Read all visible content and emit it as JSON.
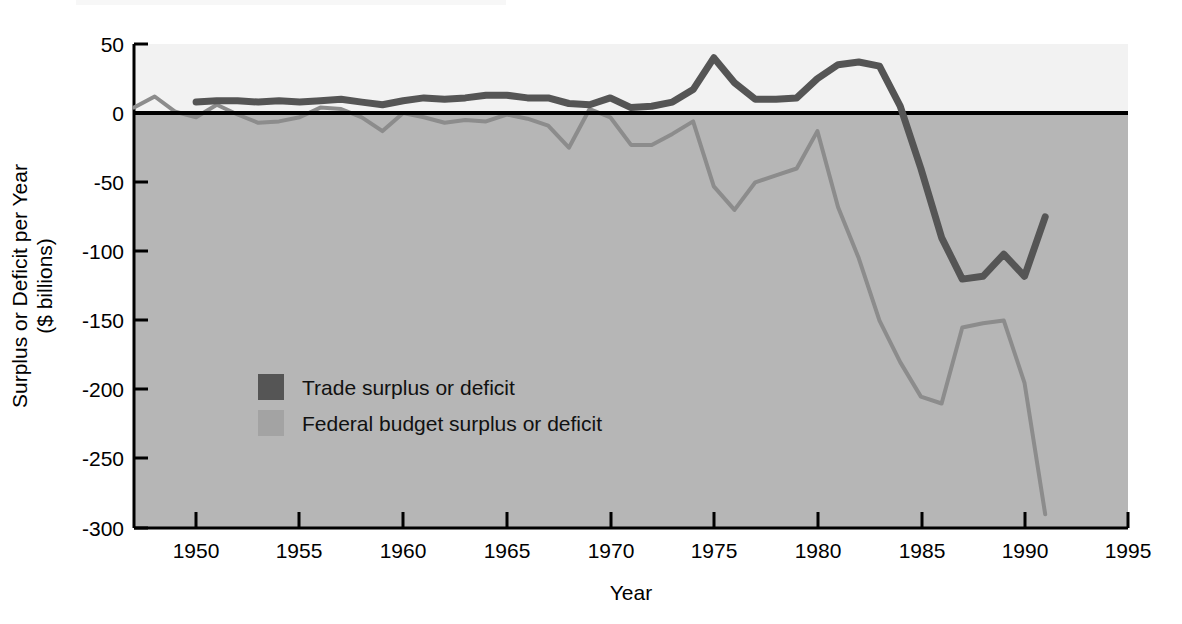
{
  "chart_data": {
    "type": "line",
    "title": "",
    "xlabel": "Year",
    "ylabel": "Surplus or Deficit per Year\n($ billions)",
    "ylabel_line1": "Surplus or Deficit per Year",
    "ylabel_line2": "($ billions)",
    "xlim": [
      1947,
      1995
    ],
    "ylim": [
      -300,
      50
    ],
    "xticks": [
      1950,
      1955,
      1960,
      1965,
      1970,
      1975,
      1980,
      1985,
      1990,
      1995
    ],
    "xtick_labels": [
      "1950",
      "1955",
      "1960",
      "1965",
      "1970",
      "1975",
      "1980",
      "1985",
      "1990",
      "1995"
    ],
    "yticks": [
      50,
      0,
      -50,
      -100,
      -150,
      -200,
      -250,
      -300
    ],
    "ytick_labels": [
      "50",
      "0",
      "-50",
      "-100",
      "-150",
      "-200",
      "-250",
      "-300"
    ],
    "grid": false,
    "legend_position": "center-left",
    "zero_line": 0,
    "plot_bg_above_zero": "#f2f2f2",
    "plot_bg_below_zero": "#b6b6b6",
    "series": [
      {
        "name": "Trade surplus or deficit",
        "color": "#555555",
        "line_width": 6,
        "x": [
          1950,
          1951,
          1952,
          1953,
          1954,
          1955,
          1956,
          1957,
          1958,
          1959,
          1960,
          1961,
          1962,
          1963,
          1964,
          1965,
          1966,
          1967,
          1968,
          1969,
          1970,
          1971,
          1972,
          1973,
          1974,
          1975,
          1976,
          1977,
          1978,
          1979,
          1980,
          1981,
          1982,
          1983,
          1984,
          1985,
          1986,
          1987,
          1988,
          1989,
          1990,
          1991
        ],
        "values": [
          8,
          9,
          9,
          8,
          9,
          8,
          9,
          10,
          8,
          6,
          9,
          11,
          10,
          11,
          13,
          13,
          11,
          11,
          7,
          6,
          11,
          4,
          5,
          8,
          17,
          40,
          22,
          10,
          10,
          11,
          25,
          35,
          37,
          34,
          5,
          -40,
          -90,
          -120,
          -118,
          -102,
          -118,
          -75
        ]
      },
      {
        "name": "Federal budget surplus or deficit",
        "color": "#8c8c8c",
        "line_width": 6,
        "x": [
          1947,
          1948,
          1949,
          1950,
          1951,
          1952,
          1953,
          1954,
          1955,
          1956,
          1957,
          1958,
          1959,
          1960,
          1961,
          1962,
          1963,
          1964,
          1965,
          1966,
          1967,
          1968,
          1969,
          1970,
          1971,
          1972,
          1973,
          1974,
          1975,
          1976,
          1977,
          1978,
          1979,
          1980,
          1981,
          1982,
          1983,
          1984,
          1985,
          1986,
          1987,
          1988,
          1989,
          1990,
          1991
        ],
        "values": [
          4,
          12,
          1,
          -3,
          6,
          -1,
          -7,
          -6,
          -3,
          4,
          3,
          -3,
          -13,
          0,
          -3,
          -7,
          -5,
          -6,
          -1,
          -4,
          -9,
          -25,
          3,
          -3,
          -23,
          -23,
          -15,
          -6,
          -53,
          -70,
          -50,
          -45,
          -40,
          -13,
          -68,
          -105,
          -150,
          -180,
          -205,
          -210,
          -155,
          -152,
          -150,
          -195,
          -290
        ]
      }
    ]
  },
  "legend": {
    "items": [
      {
        "label": "Trade surplus or deficit",
        "color": "#555555"
      },
      {
        "label": "Federal budget surplus or deficit",
        "color": "#a3a3a3"
      }
    ]
  },
  "axes": {
    "x_title": "Year",
    "y_title_line1": "Surplus or Deficit per Year",
    "y_title_line2": "($ billions)"
  }
}
